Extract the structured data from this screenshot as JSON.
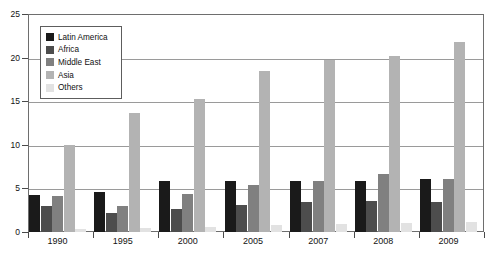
{
  "chart_data": {
    "type": "bar",
    "title": "",
    "xlabel": "",
    "ylabel": "",
    "ylim": [
      0,
      25
    ],
    "yticks": [
      0,
      5,
      10,
      15,
      20,
      25
    ],
    "grid": true,
    "legend_position": "top-left",
    "categories": [
      "1990",
      "1995",
      "2000",
      "2005",
      "2007",
      "2008",
      "2009"
    ],
    "series": [
      {
        "name": "Latin America",
        "color": "#1a1a1a",
        "values": [
          4.3,
          4.6,
          5.9,
          5.8,
          5.9,
          5.9,
          6.1
        ]
      },
      {
        "name": "Africa",
        "color": "#4d4d4d",
        "values": [
          3.0,
          2.2,
          2.6,
          3.1,
          3.4,
          3.5,
          3.4
        ]
      },
      {
        "name": "Middle East",
        "color": "#808080",
        "values": [
          4.1,
          3.0,
          4.4,
          5.4,
          5.9,
          6.7,
          6.1
        ]
      },
      {
        "name": "Asia",
        "color": "#b3b3b3",
        "values": [
          10.0,
          13.6,
          15.3,
          18.5,
          19.7,
          20.2,
          21.8
        ]
      },
      {
        "name": "Others",
        "color": "#e2e2e2",
        "values": [
          0.35,
          0.5,
          0.55,
          0.8,
          0.95,
          1.0,
          1.15
        ]
      }
    ]
  },
  "legend": {
    "items": [
      {
        "label": "Latin America"
      },
      {
        "label": "Africa"
      },
      {
        "label": "Middle East"
      },
      {
        "label": "Asia"
      },
      {
        "label": "Others"
      }
    ]
  },
  "axes": {
    "y_tick_labels": [
      "0",
      "5",
      "10",
      "15",
      "20",
      "25"
    ],
    "x_tick_labels": [
      "1990",
      "1995",
      "2000",
      "2005",
      "2007",
      "2008",
      "2009"
    ]
  }
}
